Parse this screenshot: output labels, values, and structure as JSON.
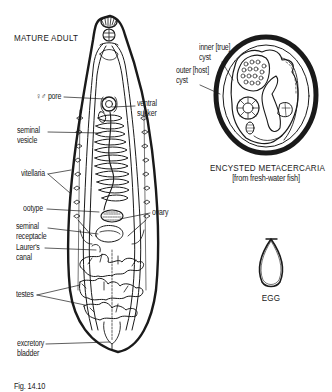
{
  "figure": {
    "panels": [
      {
        "id": "adult",
        "title": "MATURE ADULT",
        "labels": [
          {
            "id": "genital-pore",
            "text": "♀♂ pore"
          },
          {
            "id": "ventral-sucker",
            "line1": "ventral",
            "line2": "sucker"
          },
          {
            "id": "seminal-vesicle",
            "line1": "seminal",
            "line2": "vesicle"
          },
          {
            "id": "vitellaria",
            "text": "vitellaria"
          },
          {
            "id": "ootype",
            "text": "ootype"
          },
          {
            "id": "ovary",
            "text": "ovary"
          },
          {
            "id": "seminal-receptacle",
            "line1": "seminal",
            "line2": "receptacle"
          },
          {
            "id": "laurers-canal",
            "line1": "Laurer's",
            "line2": "canal"
          },
          {
            "id": "testes",
            "text": "testes"
          },
          {
            "id": "excretory-bladder",
            "line1": "excretory",
            "line2": "bladder"
          }
        ]
      },
      {
        "id": "metacercaria",
        "title": "ENCYSTED METACERCARIA",
        "subtitle": "[from fresh-water fish]",
        "labels": [
          {
            "id": "inner-cyst",
            "line1": "inner [true]",
            "line2": "cyst"
          },
          {
            "id": "outer-cyst",
            "line1": "outer [host]",
            "line2": "cyst"
          }
        ]
      },
      {
        "id": "egg",
        "title": "EGG"
      }
    ],
    "caption": "Fig. 14.10"
  }
}
